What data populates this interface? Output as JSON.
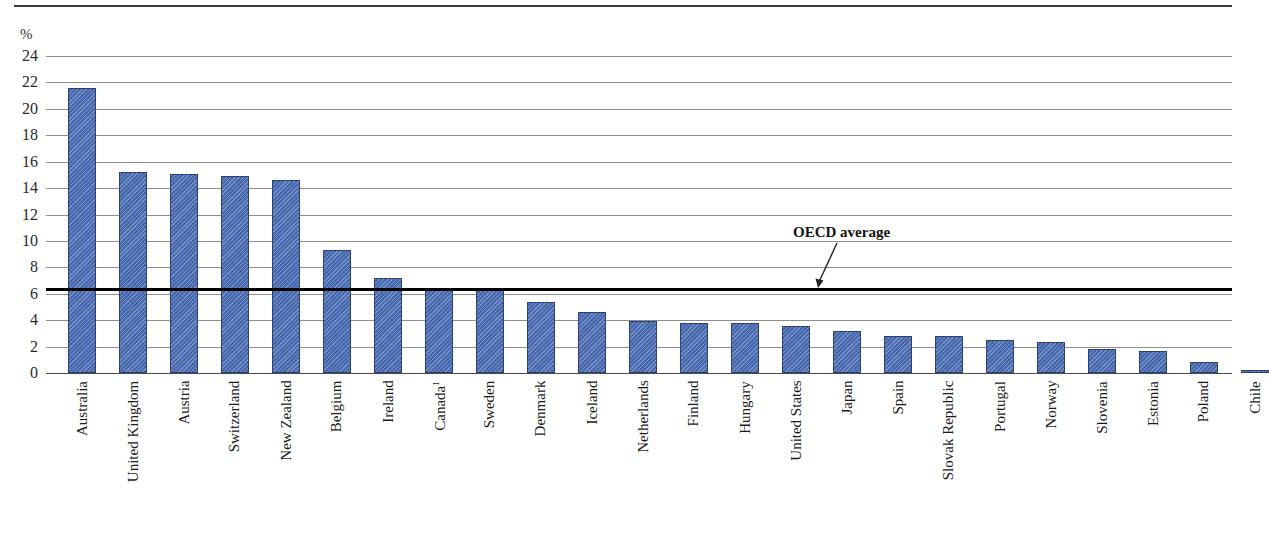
{
  "figure": {
    "unit_label": "%",
    "partial_title": ""
  },
  "annotations": {
    "oecd_average_label": "OECD average"
  },
  "chart_data": {
    "type": "bar",
    "title": "",
    "subtitle": "",
    "xlabel": "",
    "ylabel": "%",
    "ylim": [
      0,
      24
    ],
    "ytick_step": 2,
    "ytick_labels": [
      "0",
      "2",
      "4",
      "6",
      "8",
      "10",
      "12",
      "14",
      "16",
      "18",
      "20",
      "22",
      "24"
    ],
    "grid": true,
    "legend": "none",
    "bar_color": "#4a6cb3",
    "bar_edge_color": "#2c3f6e",
    "reference_line": {
      "label": "OECD average",
      "value": 6.4,
      "color": "#000000"
    },
    "categories": [
      "Australia",
      "United Kingdom",
      "Austria",
      "Switzerland",
      "New Zealand",
      "Belgium",
      "Ireland",
      "Canada¹",
      "Sweden",
      "Denmark",
      "Iceland",
      "Netherlands",
      "Finland",
      "Hungary",
      "United States",
      "Japan",
      "Spain",
      "Slovak Republic",
      "Portugal",
      "Norway",
      "Slovenia",
      "Estonia",
      "Poland",
      "Chile"
    ],
    "values": [
      21.6,
      15.2,
      15.1,
      14.9,
      14.6,
      9.3,
      7.2,
      6.4,
      6.3,
      5.4,
      4.6,
      3.9,
      3.8,
      3.75,
      3.55,
      3.2,
      2.8,
      2.8,
      2.5,
      2.35,
      1.85,
      1.65,
      0.85,
      0.25
    ]
  }
}
